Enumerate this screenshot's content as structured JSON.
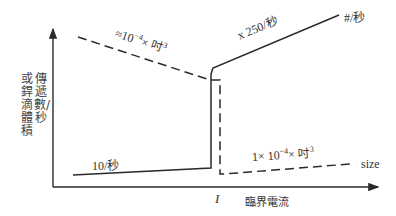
{
  "diagram": {
    "y_axis": {
      "label_col_right": "傳遞數/秒",
      "label_col_left": "或銲滴體積"
    },
    "x_axis": {
      "tick_label": "I",
      "label": "臨界電流"
    },
    "series": {
      "rate": {
        "style": "solid",
        "low_label": "10/秒",
        "high_label": "x 250/秒",
        "end_label": "#/秒"
      },
      "size": {
        "style": "dashed",
        "high_label_prefix": "≈10",
        "high_label_exp": "−4",
        "high_label_suffix": "× 吋",
        "high_label_suffix_exp": "3",
        "low_label_prefix": "1× 10",
        "low_label_exp": "−4",
        "low_label_suffix": "× 吋",
        "low_label_suffix_exp": "3",
        "end_label": "size"
      }
    },
    "colors": {
      "line": "#2a2a2a",
      "background": "#ffffff"
    }
  }
}
